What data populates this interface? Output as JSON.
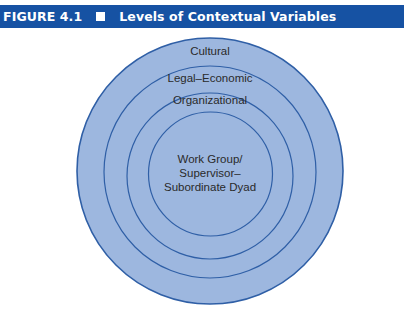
{
  "figure": {
    "number": "FIGURE 4.1",
    "title": "Levels of Contextual Variables",
    "header_color": "#1652a3"
  },
  "diagram": {
    "type": "nested-circles",
    "fill_color": "#9db7df",
    "stroke_color": "#2f5fa6",
    "levels": [
      {
        "label": "Cultural"
      },
      {
        "label": "Legal–Economic"
      },
      {
        "label": "Organizational"
      },
      {
        "label_lines": [
          "Work Group/",
          "Supervisor–",
          "Subordinate Dyad"
        ]
      }
    ]
  }
}
